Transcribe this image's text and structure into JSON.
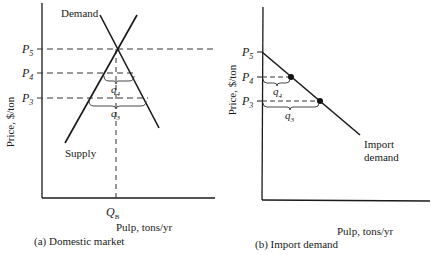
{
  "panels": [
    {
      "id": "a",
      "caption": "(a) Domestic market",
      "y_axis_label": "Price, $/ton",
      "x_axis_label": "Pulp, tons/yr",
      "price_levels": [
        {
          "sym": "P",
          "sub": "5"
        },
        {
          "sym": "P",
          "sub": "4"
        },
        {
          "sym": "P",
          "sub": "3"
        }
      ],
      "quantity_brackets": [
        {
          "sym": "q",
          "sub": "4"
        },
        {
          "sym": "q",
          "sub": "3"
        }
      ],
      "curves": {
        "demand": "Demand",
        "supply": "Supply"
      },
      "equilibrium_quantity": {
        "sym": "Q",
        "sub": "B"
      }
    },
    {
      "id": "b",
      "caption": "(b) Import demand",
      "y_axis_label": "Price, $/ton",
      "x_axis_label": "Pulp, tons/yr",
      "price_levels": [
        {
          "sym": "P",
          "sub": "5"
        },
        {
          "sym": "P",
          "sub": "4"
        },
        {
          "sym": "P",
          "sub": "3"
        }
      ],
      "quantity_brackets": [
        {
          "sym": "q",
          "sub": "4"
        },
        {
          "sym": "q",
          "sub": "3"
        }
      ],
      "curves": {
        "import_demand_line1": "Import",
        "import_demand_line2": "demand"
      }
    }
  ],
  "colors": {
    "ink": "#1a1a1a",
    "dash": "#333333"
  }
}
